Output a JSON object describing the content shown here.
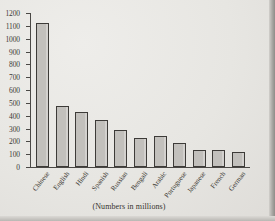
{
  "figure": {
    "caption": "(Numbers in millions)",
    "title_ghost": "",
    "paper_color": "#e7e6e2",
    "bar_fill": "#c2c0bc",
    "bar_stroke": "#3d3b38",
    "axis_color": "#4a4845"
  },
  "chart_data": {
    "type": "bar",
    "title": "",
    "xlabel": "",
    "ylabel": "",
    "caption": "(Numbers in millions)",
    "ylim": [
      0,
      1200
    ],
    "ytick_step": 100,
    "yticks": [
      1200,
      1100,
      1000,
      900,
      800,
      700,
      600,
      500,
      400,
      300,
      200,
      100,
      0
    ],
    "grid": false,
    "legend": false,
    "categories": [
      "Chinese",
      "English",
      "Hindi",
      "Spanish",
      "Russian",
      "Bengali",
      "Arabic",
      "Portuguese",
      "Japanese",
      "French",
      "German"
    ],
    "values": [
      1120,
      475,
      425,
      370,
      290,
      225,
      240,
      190,
      135,
      135,
      120
    ]
  }
}
